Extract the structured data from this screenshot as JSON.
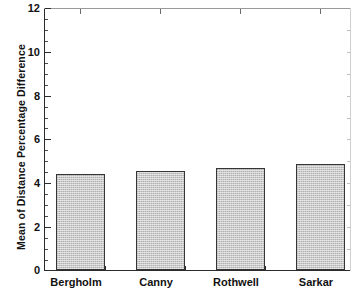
{
  "chart_data": {
    "type": "bar",
    "title": "",
    "xlabel": "",
    "ylabel": "Mean of Distance Percentage Difference",
    "categories": [
      "Bergholm",
      "Canny",
      "Rothwell",
      "Sarkar"
    ],
    "values": [
      4.4,
      4.55,
      4.65,
      4.85
    ],
    "ylim": [
      0,
      12
    ],
    "yticks": [
      0,
      2,
      4,
      6,
      8,
      10,
      12
    ],
    "ytick_labels": [
      "0",
      "2",
      "4",
      "6",
      "8",
      "10",
      "12"
    ],
    "minor_tick_interval": 0.5,
    "grid": false,
    "legend": null,
    "bar_fill_color": "#c9c9c9",
    "bar_edge_color": "#363636",
    "axis_color": "#2b2b2b",
    "background_color": "#ffffff"
  },
  "axes": {
    "y_title": "Mean of Distance Percentage Difference",
    "y_tick_labels": [
      "12",
      "10",
      "8",
      "6",
      "4",
      "2",
      "0"
    ],
    "x_tick_labels": [
      "Bergholm",
      "Canny",
      "Rothwell",
      "Sarkar"
    ]
  }
}
